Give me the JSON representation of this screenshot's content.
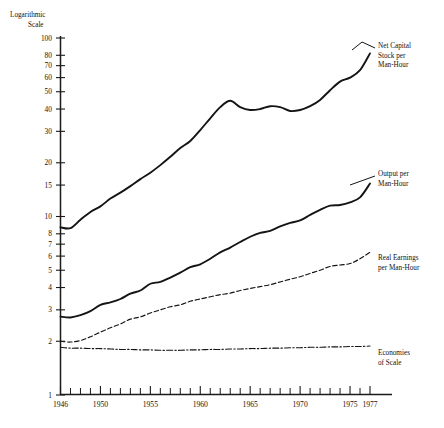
{
  "chart_data": {
    "type": "line",
    "title": "",
    "ylabel": "Logarithmic Scale",
    "xlabel": "",
    "scale": "log",
    "grid": false,
    "legend_position": "right-inline-labels",
    "xlim": [
      1946,
      1977
    ],
    "ylim": [
      1,
      100
    ],
    "x_ticks": [
      1946,
      1950,
      1955,
      1960,
      1965,
      1970,
      1975,
      1977
    ],
    "x_tick_labels": [
      "1946",
      "1950",
      "1955",
      "1960",
      "1965",
      "1970",
      "1975",
      "1977"
    ],
    "x_minor_ticks": [
      1947,
      1948,
      1949,
      1951,
      1952,
      1953,
      1954,
      1956,
      1957,
      1958,
      1959,
      1961,
      1962,
      1963,
      1964,
      1966,
      1967,
      1968,
      1969,
      1971,
      1972,
      1973,
      1974,
      1976
    ],
    "y_ticks": [
      1,
      2,
      3,
      4,
      5,
      6,
      7,
      8,
      10,
      15,
      20,
      30,
      40,
      50,
      60,
      70,
      80,
      100
    ],
    "y_tick_labels": [
      "1",
      "2",
      "3",
      "4",
      "5",
      "6",
      "7",
      "8",
      "10",
      "15",
      "20",
      "30",
      "40",
      "50",
      "60",
      "70",
      "80",
      "100"
    ],
    "series": [
      {
        "name": "Net Capital Stock per Man-Hour",
        "label_lines": [
          "Net Capital",
          "Stock per",
          "Man-Hour"
        ],
        "style": "solid",
        "linewidth": "thick",
        "x": [
          1946,
          1947,
          1948,
          1949,
          1950,
          1951,
          1952,
          1953,
          1954,
          1955,
          1956,
          1957,
          1958,
          1959,
          1960,
          1961,
          1962,
          1963,
          1964,
          1965,
          1966,
          1967,
          1968,
          1969,
          1970,
          1971,
          1972,
          1973,
          1974,
          1975,
          1976,
          1977
        ],
        "y": [
          8.7,
          8.6,
          9.6,
          10.6,
          11.4,
          12.6,
          13.6,
          14.8,
          16.2,
          17.6,
          19.4,
          21.6,
          24.2,
          26.5,
          30.5,
          35.5,
          41.0,
          44.5,
          41.0,
          39.5,
          40.0,
          41.5,
          41.0,
          39.0,
          39.5,
          41.5,
          45.0,
          51.0,
          57.0,
          60.0,
          66.0,
          82.0
        ]
      },
      {
        "name": "Output per Man-Hour",
        "label_lines": [
          "Output per",
          "Man-Hour"
        ],
        "style": "solid",
        "linewidth": "thick",
        "x": [
          1946,
          1947,
          1948,
          1949,
          1950,
          1951,
          1952,
          1953,
          1954,
          1955,
          1956,
          1957,
          1958,
          1959,
          1960,
          1961,
          1962,
          1963,
          1964,
          1965,
          1966,
          1967,
          1968,
          1969,
          1970,
          1971,
          1972,
          1973,
          1974,
          1975,
          1976,
          1977
        ],
        "y": [
          2.75,
          2.72,
          2.8,
          2.95,
          3.2,
          3.3,
          3.45,
          3.7,
          3.85,
          4.2,
          4.3,
          4.55,
          4.85,
          5.2,
          5.4,
          5.8,
          6.3,
          6.7,
          7.2,
          7.7,
          8.1,
          8.3,
          8.8,
          9.2,
          9.5,
          10.2,
          10.9,
          11.5,
          11.6,
          12.0,
          12.8,
          15.3
        ]
      },
      {
        "name": "Real Earnings per Man-Hour",
        "label_lines": [
          "Real Earnings",
          "per Man-Hour"
        ],
        "style": "dashed",
        "linewidth": "thin",
        "x": [
          1946,
          1947,
          1948,
          1949,
          1950,
          1951,
          1952,
          1953,
          1954,
          1955,
          1956,
          1957,
          1958,
          1959,
          1960,
          1961,
          1962,
          1963,
          1964,
          1965,
          1966,
          1967,
          1968,
          1969,
          1970,
          1971,
          1972,
          1973,
          1974,
          1975,
          1976,
          1977
        ],
        "y": [
          2.0,
          1.98,
          2.02,
          2.12,
          2.25,
          2.38,
          2.5,
          2.66,
          2.74,
          2.88,
          3.0,
          3.12,
          3.2,
          3.35,
          3.45,
          3.55,
          3.65,
          3.72,
          3.85,
          3.95,
          4.05,
          4.15,
          4.3,
          4.45,
          4.6,
          4.8,
          5.0,
          5.25,
          5.35,
          5.45,
          5.8,
          6.3
        ]
      },
      {
        "name": "Economies of Scale",
        "label_lines": [
          "Economies",
          "of Scale"
        ],
        "style": "dashdot",
        "linewidth": "thin",
        "x": [
          1946,
          1947,
          1948,
          1949,
          1950,
          1951,
          1952,
          1953,
          1954,
          1955,
          1956,
          1957,
          1958,
          1959,
          1960,
          1961,
          1962,
          1963,
          1964,
          1965,
          1966,
          1967,
          1968,
          1969,
          1970,
          1971,
          1972,
          1973,
          1974,
          1975,
          1976,
          1977
        ],
        "y": [
          1.85,
          1.83,
          1.83,
          1.82,
          1.82,
          1.81,
          1.8,
          1.8,
          1.79,
          1.79,
          1.78,
          1.78,
          1.78,
          1.79,
          1.79,
          1.8,
          1.8,
          1.81,
          1.81,
          1.82,
          1.82,
          1.83,
          1.83,
          1.84,
          1.84,
          1.85,
          1.85,
          1.86,
          1.86,
          1.87,
          1.87,
          1.88
        ]
      }
    ]
  },
  "axis": {
    "y_title_line1": "Logarithmic",
    "y_title_line2": "Scale"
  }
}
